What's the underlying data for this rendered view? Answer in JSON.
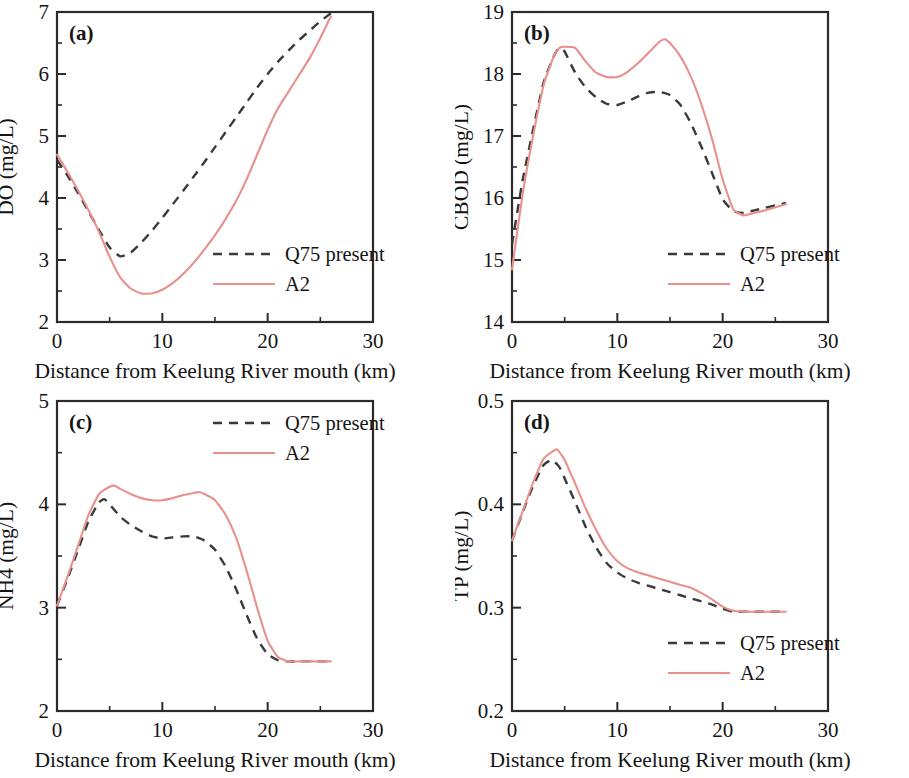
{
  "figure": {
    "width": 909,
    "height": 778,
    "background": "#ffffff",
    "series_colors": {
      "q75_present": "#3a3a3a",
      "a2": "#e8918c"
    },
    "shared_xlabel": "Distance from Keelung River mouth (km)",
    "legend_labels": {
      "dashed": "Q75 present",
      "solid": "A2"
    }
  },
  "chart_data": [
    {
      "id": "panel-a",
      "type": "line",
      "panel_tag": "(a)",
      "title": "",
      "xlabel": "Distance from Keelung River mouth (km)",
      "ylabel": "DO (mg/L)",
      "xlim": [
        0,
        30
      ],
      "ylim": [
        2,
        7
      ],
      "x_major_ticks": [
        0,
        10,
        20,
        30
      ],
      "x_minor_ticks": [
        5,
        15,
        25
      ],
      "y_major_ticks": [
        2,
        3,
        4,
        5,
        6,
        7
      ],
      "y_minor_ticks": [
        2.5,
        3.5,
        4.5,
        5.5,
        6.5
      ],
      "x_ticklabels": [
        "0",
        "10",
        "20",
        "30"
      ],
      "y_ticklabels": [
        "2",
        "3",
        "4",
        "5",
        "6",
        "7"
      ],
      "grid": false,
      "legend_position": "lower-right",
      "series": [
        {
          "name": "Q75 present",
          "style": "dashed",
          "color": "#3a3a3a",
          "x": [
            0,
            1,
            2,
            3,
            4,
            5,
            6,
            7,
            8,
            9,
            10,
            11,
            12,
            13,
            14,
            15,
            16,
            17,
            18,
            19,
            20,
            21,
            22,
            23,
            24,
            25,
            26
          ],
          "y": [
            4.62,
            4.36,
            4.08,
            3.78,
            3.48,
            3.2,
            3.06,
            3.12,
            3.28,
            3.47,
            3.68,
            3.9,
            4.12,
            4.35,
            4.58,
            4.82,
            5.06,
            5.3,
            5.54,
            5.78,
            6.0,
            6.2,
            6.38,
            6.55,
            6.7,
            6.85,
            6.98
          ]
        },
        {
          "name": "A2",
          "style": "solid",
          "color": "#e8918c",
          "x": [
            0,
            1,
            2,
            3,
            4,
            5,
            6,
            7,
            8,
            9,
            10,
            11,
            12,
            13,
            14,
            15,
            16,
            17,
            18,
            19,
            20,
            21,
            22,
            23,
            24,
            25,
            26
          ],
          "y": [
            4.7,
            4.42,
            4.12,
            3.8,
            3.45,
            3.05,
            2.72,
            2.54,
            2.46,
            2.46,
            2.52,
            2.63,
            2.78,
            2.96,
            3.17,
            3.4,
            3.66,
            3.95,
            4.3,
            4.7,
            5.1,
            5.45,
            5.72,
            5.99,
            6.26,
            6.58,
            6.93
          ]
        }
      ]
    },
    {
      "id": "panel-b",
      "type": "line",
      "panel_tag": "(b)",
      "title": "",
      "xlabel": "Distance from Keelung River mouth (km)",
      "ylabel": "CBOD (mg/L)",
      "xlim": [
        0,
        30
      ],
      "ylim": [
        14,
        19
      ],
      "x_major_ticks": [
        0,
        10,
        20,
        30
      ],
      "x_minor_ticks": [
        5,
        15,
        25
      ],
      "y_major_ticks": [
        14,
        15,
        16,
        17,
        18,
        19
      ],
      "y_minor_ticks": [
        14.5,
        15.5,
        16.5,
        17.5,
        18.5
      ],
      "x_ticklabels": [
        "0",
        "10",
        "20",
        "30"
      ],
      "y_ticklabels": [
        "14",
        "15",
        "16",
        "17",
        "18",
        "19"
      ],
      "grid": false,
      "legend_position": "lower-right",
      "series": [
        {
          "name": "Q75 present",
          "style": "dashed",
          "color": "#3a3a3a",
          "x": [
            0,
            1,
            2,
            3,
            4,
            4.5,
            5,
            6,
            7,
            8,
            9,
            10,
            11,
            12,
            13,
            14,
            15,
            16,
            17,
            18,
            19,
            20,
            21,
            22,
            23,
            24,
            25,
            26
          ],
          "y": [
            15.25,
            16.28,
            17.1,
            17.86,
            18.3,
            18.42,
            18.36,
            18.02,
            17.78,
            17.62,
            17.52,
            17.5,
            17.56,
            17.64,
            17.7,
            17.71,
            17.66,
            17.5,
            17.2,
            16.82,
            16.4,
            15.98,
            15.79,
            15.76,
            15.8,
            15.84,
            15.88,
            15.92
          ]
        },
        {
          "name": "A2",
          "style": "solid",
          "color": "#e8918c",
          "x": [
            0,
            1,
            2,
            3,
            4,
            4.5,
            5,
            6,
            7,
            8,
            9,
            10,
            11,
            12,
            13,
            14,
            14.5,
            15,
            16,
            17,
            18,
            19,
            20,
            21,
            22,
            23,
            24,
            25,
            26
          ],
          "y": [
            14.85,
            16.05,
            17.0,
            17.82,
            18.3,
            18.42,
            18.44,
            18.42,
            18.2,
            18.02,
            17.95,
            17.95,
            18.04,
            18.18,
            18.35,
            18.52,
            18.56,
            18.5,
            18.28,
            17.95,
            17.5,
            16.95,
            16.3,
            15.82,
            15.72,
            15.76,
            15.8,
            15.85,
            15.9
          ]
        }
      ]
    },
    {
      "id": "panel-c",
      "type": "line",
      "panel_tag": "(c)",
      "title": "",
      "xlabel": "Distance from Keelung River mouth (km)",
      "ylabel": "NH4 (mg/L)",
      "xlim": [
        0,
        30
      ],
      "ylim": [
        2,
        5
      ],
      "x_major_ticks": [
        0,
        10,
        20,
        30
      ],
      "x_minor_ticks": [
        5,
        15,
        25
      ],
      "y_major_ticks": [
        2,
        3,
        4,
        5
      ],
      "y_minor_ticks": [
        2.5,
        3.5,
        4.5
      ],
      "x_ticklabels": [
        "0",
        "10",
        "20",
        "30"
      ],
      "y_ticklabels": [
        "2",
        "3",
        "4",
        "5"
      ],
      "grid": false,
      "legend_position": "upper-right",
      "series": [
        {
          "name": "Q75 present",
          "style": "dashed",
          "color": "#3a3a3a",
          "x": [
            0,
            1,
            2,
            3,
            4,
            4.5,
            5,
            6,
            7,
            8,
            9,
            10,
            11,
            12,
            13,
            14,
            15,
            16,
            17,
            18,
            19,
            20,
            21,
            22,
            23,
            24,
            25,
            26
          ],
          "y": [
            3.02,
            3.28,
            3.56,
            3.84,
            4.02,
            4.05,
            4.0,
            3.88,
            3.8,
            3.74,
            3.69,
            3.67,
            3.68,
            3.69,
            3.69,
            3.65,
            3.56,
            3.4,
            3.18,
            2.93,
            2.7,
            2.55,
            2.49,
            2.48,
            2.48,
            2.48,
            2.48,
            2.48
          ]
        },
        {
          "name": "A2",
          "style": "solid",
          "color": "#e8918c",
          "x": [
            0,
            1,
            2,
            3,
            4,
            5,
            5.5,
            6,
            7,
            8,
            9,
            10,
            11,
            12,
            13,
            13.5,
            14,
            15,
            16,
            17,
            18,
            19,
            20,
            21,
            22,
            23,
            24,
            25,
            26
          ],
          "y": [
            3.02,
            3.3,
            3.6,
            3.9,
            4.1,
            4.17,
            4.18,
            4.15,
            4.1,
            4.06,
            4.04,
            4.04,
            4.06,
            4.09,
            4.11,
            4.12,
            4.1,
            4.04,
            3.9,
            3.68,
            3.36,
            3.0,
            2.68,
            2.52,
            2.48,
            2.48,
            2.48,
            2.48,
            2.48
          ]
        }
      ]
    },
    {
      "id": "panel-d",
      "type": "line",
      "panel_tag": "(d)",
      "title": "",
      "xlabel": "Distance from Keelung River mouth (km)",
      "ylabel": "TP (mg/L)",
      "xlim": [
        0,
        30
      ],
      "ylim": [
        0.2,
        0.5
      ],
      "x_major_ticks": [
        0,
        10,
        20,
        30
      ],
      "x_minor_ticks": [
        5,
        15,
        25
      ],
      "y_major_ticks": [
        0.2,
        0.3,
        0.4,
        0.5
      ],
      "y_minor_ticks": [
        0.25,
        0.35,
        0.45
      ],
      "x_ticklabels": [
        "0",
        "10",
        "20",
        "30"
      ],
      "y_ticklabels": [
        "0.2",
        "0.3",
        "0.4",
        "0.5"
      ],
      "grid": false,
      "legend_position": "lower-right",
      "series": [
        {
          "name": "Q75 present",
          "style": "dashed",
          "color": "#3a3a3a",
          "x": [
            0,
            1,
            2,
            3,
            3.8,
            4.5,
            5,
            6,
            7,
            8,
            9,
            10,
            11,
            12,
            13,
            14,
            15,
            16,
            17,
            18,
            19,
            20,
            21,
            22,
            23,
            24,
            25,
            26
          ],
          "y": [
            0.365,
            0.392,
            0.418,
            0.438,
            0.443,
            0.436,
            0.425,
            0.402,
            0.378,
            0.358,
            0.343,
            0.334,
            0.328,
            0.324,
            0.321,
            0.318,
            0.315,
            0.312,
            0.309,
            0.306,
            0.303,
            0.299,
            0.296,
            0.296,
            0.296,
            0.296,
            0.296,
            0.296
          ]
        },
        {
          "name": "A2",
          "style": "solid",
          "color": "#e8918c",
          "x": [
            0,
            1,
            2,
            3,
            4,
            4.3,
            5,
            6,
            7,
            8,
            9,
            10,
            11,
            12,
            13,
            14,
            15,
            16,
            17,
            18,
            19,
            20,
            21,
            22,
            23,
            24,
            25,
            26
          ],
          "y": [
            0.365,
            0.393,
            0.421,
            0.444,
            0.452,
            0.453,
            0.443,
            0.42,
            0.396,
            0.375,
            0.357,
            0.345,
            0.338,
            0.334,
            0.331,
            0.328,
            0.325,
            0.322,
            0.319,
            0.314,
            0.308,
            0.301,
            0.297,
            0.296,
            0.296,
            0.296,
            0.296,
            0.296
          ]
        }
      ]
    }
  ]
}
